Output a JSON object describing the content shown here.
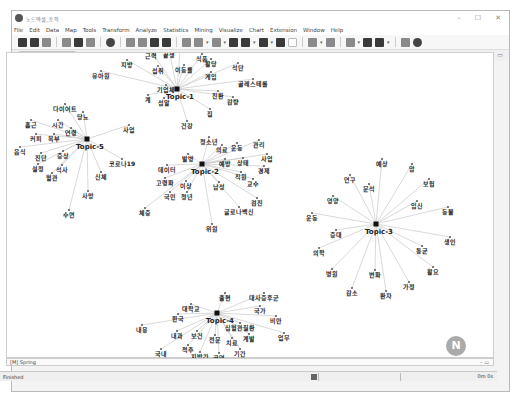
{
  "window": {
    "title": "노드엑셀_토픽",
    "controls": [
      "–",
      "☐",
      "✕"
    ]
  },
  "menu": [
    "File",
    "Edit",
    "Data",
    "Map",
    "Tools",
    "Transform",
    "Analyze",
    "Statistics",
    "Mining",
    "Visualize",
    "Chart",
    "Extension",
    "Window",
    "Help"
  ],
  "tab": {
    "label": "2-mode Spring",
    "close": "✕"
  },
  "bottom_tab": {
    "label": "[M] Spring"
  },
  "status": {
    "text": "Finished",
    "time": "0m 0s"
  },
  "graph": {
    "topics": [
      {
        "id": "Topic-1",
        "x": 176,
        "y": 76,
        "nodes": [
          {
            "label": "세종시",
            "x": 180,
            "y": 29
          },
          {
            "label": "근력",
            "x": 150,
            "y": 42
          },
          {
            "label": "끝생",
            "x": 168,
            "y": 41
          },
          {
            "label": "식품",
            "x": 201,
            "y": 45
          },
          {
            "label": "활당",
            "x": 210,
            "y": 50
          },
          {
            "label": "석단",
            "x": 237,
            "y": 54
          },
          {
            "label": "지방",
            "x": 126,
            "y": 51
          },
          {
            "label": "섭취",
            "x": 157,
            "y": 57
          },
          {
            "label": "이동률",
            "x": 183,
            "y": 56
          },
          {
            "label": "게임",
            "x": 210,
            "y": 63
          },
          {
            "label": "유아원",
            "x": 100,
            "y": 62
          },
          {
            "label": "골레스테롤",
            "x": 252,
            "y": 70
          },
          {
            "label": "기업체",
            "x": 165,
            "y": 76
          },
          {
            "label": "계",
            "x": 147,
            "y": 86
          },
          {
            "label": "섬알",
            "x": 163,
            "y": 89
          },
          {
            "label": "친환",
            "x": 217,
            "y": 82
          },
          {
            "label": "감량",
            "x": 232,
            "y": 88
          },
          {
            "label": "집",
            "x": 209,
            "y": 100
          },
          {
            "label": "건강",
            "x": 186,
            "y": 112
          }
        ]
      },
      {
        "id": "Topic-5",
        "x": 86,
        "y": 126,
        "nodes": [
          {
            "label": "다이어트",
            "x": 64,
            "y": 95
          },
          {
            "label": "당뇨",
            "x": 82,
            "y": 103
          },
          {
            "label": "흡근",
            "x": 30,
            "y": 111
          },
          {
            "label": "시간",
            "x": 57,
            "y": 111
          },
          {
            "label": "연령",
            "x": 70,
            "y": 119
          },
          {
            "label": "커피",
            "x": 35,
            "y": 125
          },
          {
            "label": "복부",
            "x": 53,
            "y": 125
          },
          {
            "label": "사업",
            "x": 128,
            "y": 116
          },
          {
            "label": "음식",
            "x": 19,
            "y": 138
          },
          {
            "label": "진단",
            "x": 40,
            "y": 144
          },
          {
            "label": "증상",
            "x": 62,
            "y": 142
          },
          {
            "label": "설정",
            "x": 37,
            "y": 155
          },
          {
            "label": "석사",
            "x": 61,
            "y": 156
          },
          {
            "label": "혈관",
            "x": 51,
            "y": 164
          },
          {
            "label": "코로나19",
            "x": 121,
            "y": 150
          },
          {
            "label": "신체",
            "x": 100,
            "y": 163
          },
          {
            "label": "사망",
            "x": 87,
            "y": 182
          },
          {
            "label": "수면",
            "x": 68,
            "y": 201
          }
        ]
      },
      {
        "id": "Topic-2",
        "x": 201,
        "y": 151,
        "nodes": [
          {
            "label": "청소년",
            "x": 208,
            "y": 128
          },
          {
            "label": "의료",
            "x": 221,
            "y": 136
          },
          {
            "label": "운동",
            "x": 236,
            "y": 134
          },
          {
            "label": "관리",
            "x": 258,
            "y": 131
          },
          {
            "label": "사업",
            "x": 266,
            "y": 145
          },
          {
            "label": "발병",
            "x": 187,
            "y": 145
          },
          {
            "label": "예방",
            "x": 224,
            "y": 150
          },
          {
            "label": "상태",
            "x": 242,
            "y": 149
          },
          {
            "label": "경제",
            "x": 263,
            "y": 157
          },
          {
            "label": "데이터",
            "x": 166,
            "y": 156
          },
          {
            "label": "직원",
            "x": 240,
            "y": 163
          },
          {
            "label": "교수",
            "x": 252,
            "y": 170
          },
          {
            "label": "고령화",
            "x": 164,
            "y": 169
          },
          {
            "label": "이상",
            "x": 185,
            "y": 172
          },
          {
            "label": "남성",
            "x": 218,
            "y": 173
          },
          {
            "label": "국민",
            "x": 169,
            "y": 183
          },
          {
            "label": "청년",
            "x": 186,
            "y": 183
          },
          {
            "label": "검진",
            "x": 256,
            "y": 189
          },
          {
            "label": "체중",
            "x": 144,
            "y": 199
          },
          {
            "label": "글로나백신",
            "x": 238,
            "y": 198
          },
          {
            "label": "위원",
            "x": 211,
            "y": 215
          }
        ]
      },
      {
        "id": "Topic-3",
        "x": 375,
        "y": 211,
        "nodes": [
          {
            "label": "예상",
            "x": 381,
            "y": 150
          },
          {
            "label": "암",
            "x": 411,
            "y": 155
          },
          {
            "label": "연구",
            "x": 349,
            "y": 166
          },
          {
            "label": "문석",
            "x": 368,
            "y": 175
          },
          {
            "label": "보험",
            "x": 428,
            "y": 170
          },
          {
            "label": "영양",
            "x": 332,
            "y": 187
          },
          {
            "label": "임신",
            "x": 416,
            "y": 192
          },
          {
            "label": "동물",
            "x": 447,
            "y": 198
          },
          {
            "label": "운동",
            "x": 311,
            "y": 204
          },
          {
            "label": "증대",
            "x": 335,
            "y": 221
          },
          {
            "label": "생인",
            "x": 449,
            "y": 228
          },
          {
            "label": "통균",
            "x": 421,
            "y": 237
          },
          {
            "label": "의학",
            "x": 318,
            "y": 239
          },
          {
            "label": "활요",
            "x": 432,
            "y": 258
          },
          {
            "label": "병원",
            "x": 331,
            "y": 260
          },
          {
            "label": "변화",
            "x": 374,
            "y": 261
          },
          {
            "label": "가정",
            "x": 408,
            "y": 273
          },
          {
            "label": "감소",
            "x": 351,
            "y": 279
          },
          {
            "label": "환자",
            "x": 385,
            "y": 282
          }
        ]
      },
      {
        "id": "Topic-4",
        "x": 216,
        "y": 300,
        "nodes": [
          {
            "label": "출현",
            "x": 224,
            "y": 284
          },
          {
            "label": "대사증후군",
            "x": 263,
            "y": 284
          },
          {
            "label": "대학교",
            "x": 190,
            "y": 295
          },
          {
            "label": "국가",
            "x": 259,
            "y": 297
          },
          {
            "label": "한국",
            "x": 177,
            "y": 305
          },
          {
            "label": "비만",
            "x": 275,
            "y": 307
          },
          {
            "label": "심혈관질환",
            "x": 239,
            "y": 314
          },
          {
            "label": "내용",
            "x": 141,
            "y": 316
          },
          {
            "label": "내과",
            "x": 176,
            "y": 322
          },
          {
            "label": "보건",
            "x": 196,
            "y": 322
          },
          {
            "label": "전문",
            "x": 214,
            "y": 326
          },
          {
            "label": "치료",
            "x": 231,
            "y": 329
          },
          {
            "label": "계발",
            "x": 248,
            "y": 325
          },
          {
            "label": "업무",
            "x": 283,
            "y": 324
          },
          {
            "label": "척추",
            "x": 187,
            "y": 336
          },
          {
            "label": "국내",
            "x": 160,
            "y": 340
          },
          {
            "label": "지방간",
            "x": 199,
            "y": 343
          },
          {
            "label": "골연",
            "x": 218,
            "y": 344
          },
          {
            "label": "기간",
            "x": 239,
            "y": 340
          }
        ]
      }
    ]
  },
  "colors": {
    "edge": "#c8c8c8",
    "node": "#555555",
    "topic_node": "#111111",
    "label": "#222222"
  }
}
